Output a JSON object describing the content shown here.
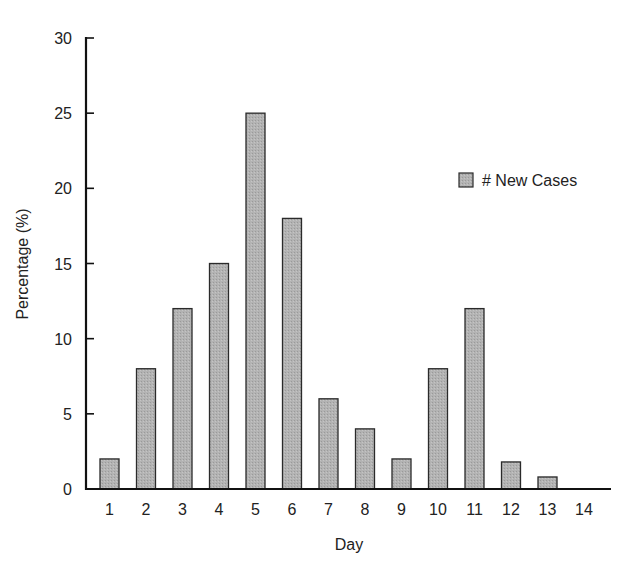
{
  "chart_data": {
    "type": "bar",
    "title": "",
    "xlabel": "Day",
    "ylabel": "Percentage (%)",
    "categories": [
      "1",
      "2",
      "3",
      "4",
      "5",
      "6",
      "7",
      "8",
      "9",
      "10",
      "11",
      "12",
      "13",
      "14"
    ],
    "series": [
      {
        "name": "# New Cases",
        "values": [
          2,
          8,
          12,
          15,
          25,
          18,
          6,
          4,
          2,
          8,
          12,
          1.8,
          0.8,
          0
        ]
      }
    ],
    "ylim": [
      0,
      30
    ],
    "yticks": [
      0,
      5,
      10,
      15,
      20,
      25,
      30
    ],
    "grid": false,
    "legend_position": "upper right",
    "colors": {
      "bar_fill": "#b3b3b3",
      "bar_stroke": "#2a2a2a",
      "axis": "#111111"
    }
  },
  "legend": {
    "label": "# New Cases"
  },
  "axes": {
    "x_title": "Day",
    "y_title": "Percentage (%)"
  }
}
